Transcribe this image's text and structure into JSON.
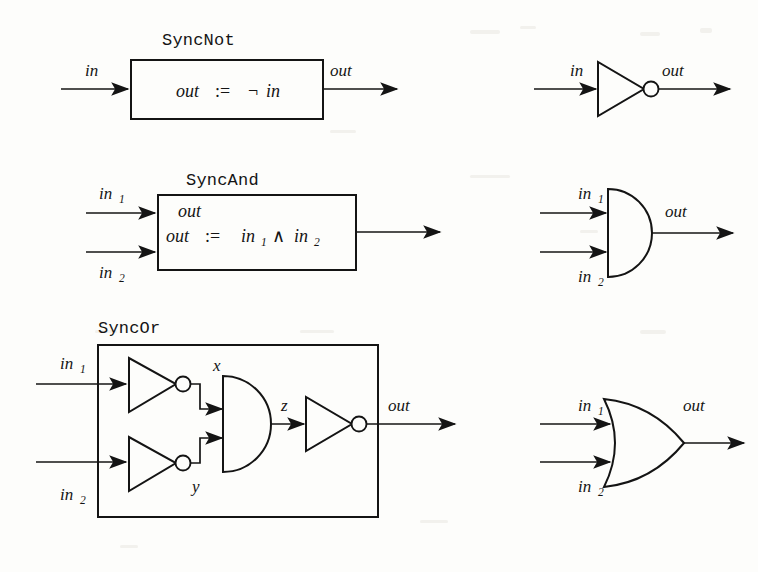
{
  "figure": {
    "background_color": "#fdfdfb",
    "ink_color": "#141414"
  },
  "rows": [
    {
      "id": "syncnot",
      "block_title": "SyncNot",
      "inputs": [
        "in"
      ],
      "output": "out",
      "body_lines": [
        "out := ¬ in"
      ],
      "formula": {
        "lhs": "out",
        "assign": ":=",
        "rhs_op": "¬",
        "rhs_args": [
          "in"
        ]
      },
      "symbol": {
        "kind": "not-gate",
        "inputs": [
          "in"
        ],
        "output": "out",
        "has_bubble": true
      }
    },
    {
      "id": "syncand",
      "block_title": "SyncAnd",
      "inputs": [
        "in",
        "in"
      ],
      "input_subs": [
        "1",
        "2"
      ],
      "output": "out",
      "stray_label": "out",
      "body_lines": [
        "out",
        "out := in₁ ∧ in₂"
      ],
      "formula": {
        "lhs": "out",
        "assign": ":=",
        "rhs_op": "∧",
        "rhs_args": [
          "in₁",
          "in₂"
        ]
      },
      "symbol": {
        "kind": "and-gate",
        "inputs": [
          "in",
          "in"
        ],
        "input_subs": [
          "1",
          "2"
        ],
        "output": "out",
        "has_bubble": false
      }
    },
    {
      "id": "syncor",
      "block_title": "SyncOr",
      "inputs": [
        "in",
        "in"
      ],
      "input_subs": [
        "1",
        "2"
      ],
      "output": "out",
      "internal_signals": [
        "x",
        "y",
        "z"
      ],
      "internal_gates": [
        {
          "type": "not-gate",
          "output_label": "x"
        },
        {
          "type": "not-gate",
          "output_label": "y"
        },
        {
          "type": "and-gate",
          "output_label": "z"
        },
        {
          "type": "not-gate",
          "output_label": "out"
        }
      ],
      "symbol": {
        "kind": "or-gate",
        "inputs": [
          "in",
          "in"
        ],
        "input_subs": [
          "1",
          "2"
        ],
        "output": "out",
        "has_bubble": false
      }
    }
  ],
  "labels": {
    "in": "in",
    "out": "out",
    "sub_1": "1",
    "sub_2": "2",
    "x": "x",
    "y": "y",
    "z": "z",
    "assign": ":=",
    "not_op": "¬",
    "and_op": "∧",
    "syncnot": "SyncNot",
    "syncand": "SyncAnd",
    "syncor": "SyncOr"
  }
}
